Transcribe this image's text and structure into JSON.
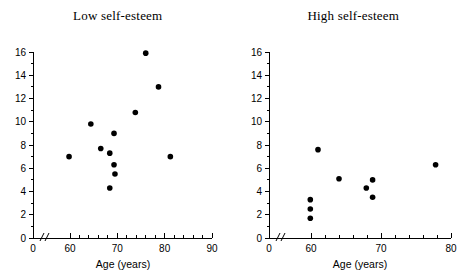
{
  "figure": {
    "background_color": "#ffffff",
    "point_color": "#000000",
    "axis_color": "#000000"
  },
  "chart_data": [
    {
      "type": "scatter",
      "title": "Low self-esteem",
      "xlabel": "Age (years)",
      "ylabel": "",
      "xlim": [
        60,
        90
      ],
      "ylim": [
        0,
        16
      ],
      "xticks": [
        0,
        60,
        70,
        80,
        90
      ],
      "xtick_labels": [
        "0",
        "60",
        "70",
        "80",
        "90"
      ],
      "yticks": [
        0,
        2,
        4,
        6,
        8,
        10,
        12,
        14,
        16
      ],
      "ytick_labels": [
        "0",
        "2",
        "4",
        "6",
        "8",
        "10",
        "12",
        "14",
        "16"
      ],
      "axis_break": true,
      "grid": false,
      "legend": false,
      "x": [
        59.8,
        64.4,
        66.5,
        68.4,
        68.4,
        69.3,
        69.3,
        69.5,
        73.8,
        76.0,
        78.7,
        81.2
      ],
      "y": [
        7.0,
        9.8,
        7.7,
        7.3,
        4.3,
        9.0,
        6.3,
        5.5,
        10.8,
        15.9,
        13.0,
        7.0
      ],
      "points": [
        {
          "x": 59.8,
          "y": 7.0
        },
        {
          "x": 64.4,
          "y": 9.8
        },
        {
          "x": 66.5,
          "y": 7.7
        },
        {
          "x": 68.4,
          "y": 7.3
        },
        {
          "x": 68.4,
          "y": 4.3
        },
        {
          "x": 69.3,
          "y": 9.0
        },
        {
          "x": 69.3,
          "y": 6.3
        },
        {
          "x": 69.5,
          "y": 5.5
        },
        {
          "x": 73.8,
          "y": 10.8
        },
        {
          "x": 76.0,
          "y": 15.9
        },
        {
          "x": 78.7,
          "y": 13.0
        },
        {
          "x": 81.2,
          "y": 7.0
        }
      ]
    },
    {
      "type": "scatter",
      "title": "High self-esteem",
      "xlabel": "Age (years)",
      "ylabel": "",
      "xlim": [
        60,
        80
      ],
      "ylim": [
        0,
        16
      ],
      "xticks": [
        0,
        60,
        70,
        80
      ],
      "xtick_labels": [
        "0",
        "60",
        "70",
        "80"
      ],
      "yticks": [
        0,
        2,
        4,
        6,
        8,
        10,
        12,
        14,
        16
      ],
      "ytick_labels": [
        "0",
        "2",
        "4",
        "6",
        "8",
        "10",
        "12",
        "14",
        "16"
      ],
      "axis_break": true,
      "grid": false,
      "legend": false,
      "x": [
        59.9,
        59.9,
        59.9,
        61.0,
        64.0,
        67.9,
        68.8,
        68.8,
        77.8
      ],
      "y": [
        3.3,
        2.5,
        1.7,
        7.6,
        5.1,
        4.3,
        5.0,
        3.5,
        6.3
      ],
      "points": [
        {
          "x": 59.9,
          "y": 3.3
        },
        {
          "x": 59.9,
          "y": 2.5
        },
        {
          "x": 59.9,
          "y": 1.7
        },
        {
          "x": 61.0,
          "y": 7.6
        },
        {
          "x": 64.0,
          "y": 5.1
        },
        {
          "x": 67.9,
          "y": 4.3
        },
        {
          "x": 68.8,
          "y": 5.0
        },
        {
          "x": 68.8,
          "y": 3.5
        },
        {
          "x": 77.8,
          "y": 6.3
        }
      ]
    }
  ]
}
